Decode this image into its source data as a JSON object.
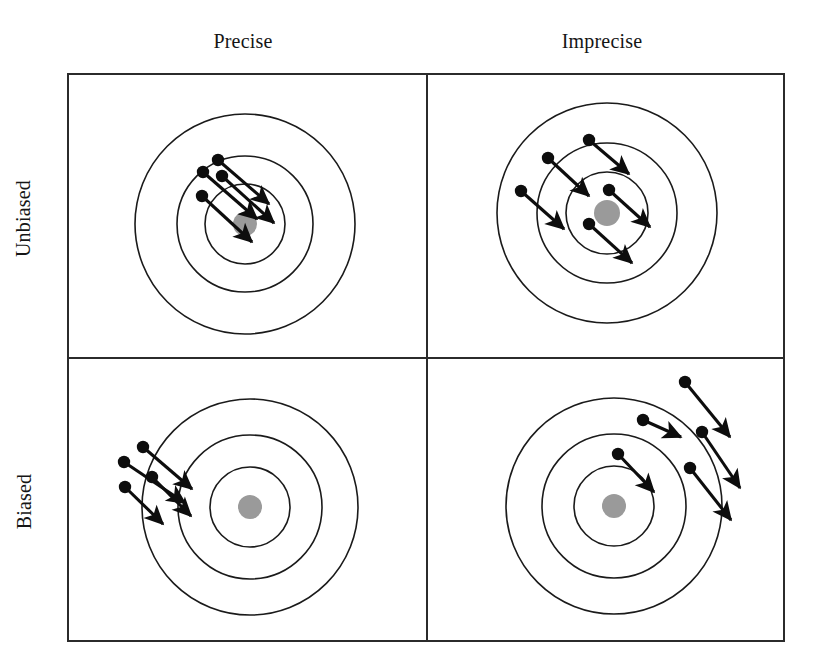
{
  "figure": {
    "type": "diagram",
    "columns": [
      {
        "key": "precise",
        "label": "Precise"
      },
      {
        "key": "imprecise",
        "label": "Imprecise"
      }
    ],
    "rows": [
      {
        "key": "unbiased",
        "label": "Unbiased"
      },
      {
        "key": "biased",
        "label": "Biased"
      }
    ],
    "colors": {
      "stroke": "#1a1a1a",
      "frame": "#2b2b2b",
      "bullseye_fill": "#9a9a9a",
      "dot_fill": "#0d0d0d",
      "background": "#ffffff"
    },
    "frame": {
      "x": 68,
      "y": 74,
      "width": 716,
      "height": 567,
      "mid_x": 427,
      "mid_y": 358,
      "stroke_width": 2
    },
    "targets": [
      {
        "cell": "unbiased-precise",
        "center": {
          "x": 245,
          "y": 224
        },
        "ring_radii": [
          110,
          68,
          40
        ],
        "bullseye_radius": 12,
        "arrows": [
          {
            "x1": 218,
            "y1": 160,
            "x2": 269,
            "y2": 204
          },
          {
            "x1": 203,
            "y1": 172,
            "x2": 257,
            "y2": 219
          },
          {
            "x1": 222,
            "y1": 176,
            "x2": 274,
            "y2": 223
          },
          {
            "x1": 202,
            "y1": 196,
            "x2": 252,
            "y2": 242
          }
        ]
      },
      {
        "cell": "unbiased-imprecise",
        "center": {
          "x": 607,
          "y": 213
        },
        "ring_radii": [
          110,
          70,
          41
        ],
        "bullseye_radius": 13,
        "arrows": [
          {
            "x1": 589,
            "y1": 140,
            "x2": 629,
            "y2": 174
          },
          {
            "x1": 548,
            "y1": 158,
            "x2": 589,
            "y2": 196
          },
          {
            "x1": 521,
            "y1": 191,
            "x2": 564,
            "y2": 229
          },
          {
            "x1": 609,
            "y1": 190,
            "x2": 650,
            "y2": 227
          },
          {
            "x1": 589,
            "y1": 224,
            "x2": 632,
            "y2": 263
          }
        ]
      },
      {
        "cell": "biased-precise",
        "center": {
          "x": 250,
          "y": 507
        },
        "ring_radii": [
          108,
          72,
          40
        ],
        "bullseye_radius": 12,
        "arrows": [
          {
            "x1": 143,
            "y1": 447,
            "x2": 192,
            "y2": 489
          },
          {
            "x1": 124,
            "y1": 462,
            "x2": 185,
            "y2": 503
          },
          {
            "x1": 152,
            "y1": 477,
            "x2": 191,
            "y2": 516
          },
          {
            "x1": 125,
            "y1": 487,
            "x2": 163,
            "y2": 524
          }
        ]
      },
      {
        "cell": "biased-imprecise",
        "center": {
          "x": 614,
          "y": 506
        },
        "ring_radii": [
          108,
          72,
          40
        ],
        "bullseye_radius": 12,
        "arrows": [
          {
            "x1": 685,
            "y1": 382,
            "x2": 730,
            "y2": 437
          },
          {
            "x1": 643,
            "y1": 420,
            "x2": 681,
            "y2": 437
          },
          {
            "x1": 702,
            "y1": 432,
            "x2": 740,
            "y2": 488
          },
          {
            "x1": 618,
            "y1": 454,
            "x2": 654,
            "y2": 492
          },
          {
            "x1": 690,
            "y1": 468,
            "x2": 731,
            "y2": 520
          }
        ]
      }
    ]
  }
}
